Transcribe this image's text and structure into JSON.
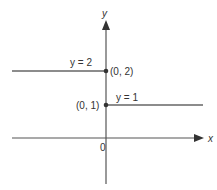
{
  "diagram": {
    "axes": {
      "x_label": "x",
      "y_label": "y",
      "origin_label": "0"
    },
    "segments": [
      {
        "equation": "y = 2",
        "from_x": "-inf",
        "to_x": 0,
        "y": 2,
        "endpoint_label": "(0, 2)",
        "endpoint_closed": true
      },
      {
        "equation": "y = 1",
        "from_x": 0,
        "to_x": "inf",
        "y": 1,
        "endpoint_label": "(0, 1)",
        "endpoint_closed": true
      }
    ],
    "colors": {
      "line": "#555555",
      "text": "#333333"
    }
  }
}
